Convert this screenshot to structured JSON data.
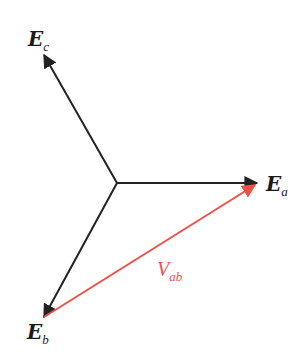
{
  "diagram": {
    "type": "phasor-diagram",
    "origin": {
      "x": 117,
      "y": 183
    },
    "colors": {
      "phasor": "#222222",
      "line_voltage": "#f0504a",
      "background": "#ffffff"
    },
    "phasors": [
      {
        "id": "Ea",
        "main": "E",
        "sub": "a",
        "tip": {
          "x": 257,
          "y": 183
        }
      },
      {
        "id": "Eb",
        "main": "E",
        "sub": "b",
        "tip": {
          "x": 44,
          "y": 317
        }
      },
      {
        "id": "Ec",
        "main": "E",
        "sub": "c",
        "tip": {
          "x": 44,
          "y": 55
        }
      }
    ],
    "line_voltage": {
      "id": "Vab",
      "main": "V",
      "sub": "ab",
      "from": "Eb",
      "to": "Ea"
    }
  }
}
